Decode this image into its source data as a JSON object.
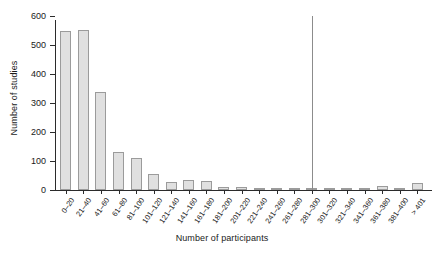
{
  "chart_data": {
    "type": "bar",
    "title": "",
    "xlabel": "Number of participants",
    "ylabel": "Number of studies",
    "categories": [
      "0–20",
      "21–40",
      "41–60",
      "61–80",
      "81–100",
      "101–120",
      "121–140",
      "141–160",
      "161–180",
      "181–200",
      "201–220",
      "221–240",
      "241–260",
      "261–280",
      "281–300",
      "301–320",
      "321–340",
      "341–360",
      "361–380",
      "381–400",
      "> 401"
    ],
    "values": [
      548,
      553,
      339,
      130,
      109,
      55,
      27,
      35,
      30,
      12,
      9,
      8,
      7,
      6,
      5,
      5,
      6,
      5,
      13,
      5,
      23
    ],
    "ylim": [
      0,
      600
    ],
    "yticks": [
      0,
      100,
      200,
      300,
      400,
      500,
      600
    ],
    "ytick_labels": [
      "0",
      "100",
      "200",
      "300",
      "400",
      "500",
      "600"
    ],
    "grid": false,
    "legend": false,
    "bar_fill_color": "#e0e0e0",
    "bar_edge_color": "#9b9b9b",
    "axis_color": "#2b2b2b",
    "annotations": [
      {
        "name": "divider-line",
        "type": "vertical-line",
        "at_category": "281–300",
        "color": "#8c8c8c"
      }
    ]
  }
}
